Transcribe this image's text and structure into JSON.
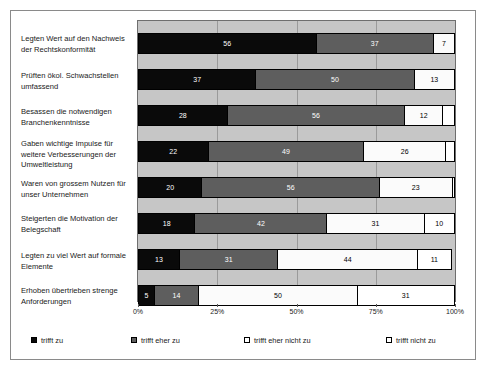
{
  "chart_data": {
    "type": "bar",
    "orientation": "horizontal",
    "stacked": true,
    "normalized_percent": true,
    "title": "",
    "subtitle": "",
    "xlabel": "",
    "ylabel": "",
    "xlim": [
      0,
      100
    ],
    "xticks": [
      "0%",
      "25%",
      "50%",
      "75%",
      "100%"
    ],
    "xtick_values": [
      0,
      25,
      50,
      75,
      100
    ],
    "grid": true,
    "legend_position": "bottom",
    "categories": [
      "Legten Wert auf den Nachweis der Rechtskonformität",
      "Prüften ökol. Schwachstellen umfassend",
      "Besassen die notwendigen Branchenkenntnisse",
      "Gaben wichtige Impulse für weitere Verbesserungen der Umweltleistung",
      "Waren von grossem Nutzen für unser Unternehmen",
      "Steigerten die Motivation der Belegschaft",
      "Legten zu viel Wert auf formale Elemente",
      "Erhoben übertrieben strenge Anforderungen"
    ],
    "series": [
      {
        "name": "trifft zu",
        "color": "#0a0a0a",
        "values": [
          56,
          37,
          28,
          22,
          20,
          18,
          13,
          5
        ]
      },
      {
        "name": "trifft eher zu",
        "color": "#5e5e5e",
        "values": [
          37,
          50,
          56,
          49,
          56,
          42,
          31,
          14
        ]
      },
      {
        "name": "trifft eher nicht zu",
        "color": "#ffffff",
        "values": [
          7,
          13,
          12,
          26,
          23,
          31,
          44,
          50
        ]
      },
      {
        "name": "trifft nicht zu",
        "color": "#ffffff",
        "values": [
          0,
          0,
          4,
          3,
          1,
          10,
          11,
          31
        ]
      }
    ],
    "bar_labels": [
      [
        "56",
        "37",
        "7",
        ""
      ],
      [
        "37",
        "50",
        "13",
        ""
      ],
      [
        "28",
        "56",
        "12",
        ""
      ],
      [
        "22",
        "49",
        "26",
        ""
      ],
      [
        "20",
        "56",
        "23",
        ""
      ],
      [
        "18",
        "42",
        "31",
        "10"
      ],
      [
        "13",
        "31",
        "44",
        "11"
      ],
      [
        "5",
        "14",
        "50",
        "31"
      ]
    ]
  },
  "legend": {
    "items": [
      {
        "label": "trifft zu"
      },
      {
        "label": "trifft eher zu"
      },
      {
        "label": "trifft eher nicht zu"
      },
      {
        "label": "trifft nicht zu"
      }
    ]
  }
}
